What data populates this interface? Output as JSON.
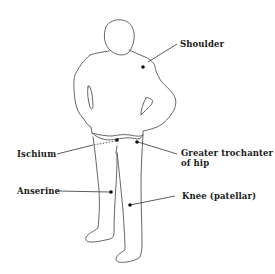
{
  "diagram": {
    "type": "anatomical-figure",
    "colors": {
      "background": "#ffffff",
      "outline": "#555555",
      "marker": "#111111",
      "leader": "#333333",
      "text": "#1a1a1a"
    },
    "labels": [
      {
        "id": "shoulder",
        "text": "Shoulder",
        "side": "right"
      },
      {
        "id": "ischium",
        "text": "Ischium",
        "side": "left"
      },
      {
        "id": "greater-trochanter",
        "text": "Greater trochanter",
        "text_line2": "of hip",
        "side": "right"
      },
      {
        "id": "anserine",
        "text": "Anserine",
        "side": "left"
      },
      {
        "id": "knee",
        "text": "Knee (patellar)",
        "side": "right"
      }
    ]
  }
}
